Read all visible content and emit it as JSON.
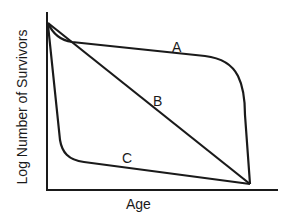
{
  "diagram": {
    "x_axis_label": "Age",
    "y_axis_label": "Log Number of Survivors",
    "curves": [
      {
        "id": "A",
        "label": "A",
        "description": "Type I - high survival until old age, then sharp decline"
      },
      {
        "id": "B",
        "label": "B",
        "description": "Type II - constant mortality rate (straight line)"
      },
      {
        "id": "C",
        "label": "C",
        "description": "Type III - high early mortality, then low mortality"
      }
    ],
    "line_color": "#1a1a1a",
    "background_color": "#ffffff"
  }
}
